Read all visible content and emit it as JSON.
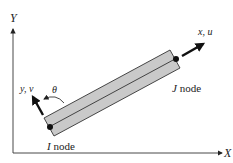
{
  "diagram": {
    "global_axes": {
      "x_label": "X",
      "y_label": "Y"
    },
    "local_axes": {
      "x_label": "x, u",
      "y_label": "y, v"
    },
    "angle_label": "θ",
    "nodes": {
      "i": {
        "letter": "I",
        "suffix": " node"
      },
      "j": {
        "letter": "J",
        "suffix": " node"
      }
    },
    "colors": {
      "bar_fill": "#c9c9c9",
      "line": "#222222",
      "background": "#ffffff"
    }
  }
}
